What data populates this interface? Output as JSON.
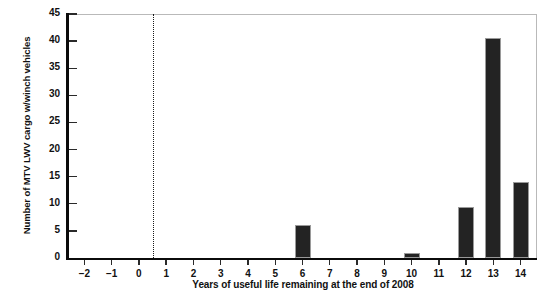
{
  "chart_data": {
    "type": "bar",
    "title": "",
    "subtitle": "",
    "xlabel": "Years of useful life remaining at the end of 2008",
    "ylabel": "Number of MTV LWV cargo w/winch vehicles",
    "categories": [
      -2,
      -1,
      0,
      1,
      2,
      3,
      4,
      5,
      6,
      7,
      8,
      9,
      10,
      11,
      12,
      13,
      14
    ],
    "values": [
      0,
      0,
      0,
      0,
      0,
      0,
      0,
      0,
      6,
      0,
      0,
      0,
      1,
      0,
      9.5,
      40.5,
      14
    ],
    "xtick_labels": [
      "−2",
      "−1",
      "0",
      "1",
      "2",
      "3",
      "4",
      "5",
      "6",
      "7",
      "8",
      "9",
      "10",
      "11",
      "12",
      "13",
      "14"
    ],
    "ytick_labels": [
      "0",
      "5",
      "10",
      "15",
      "20",
      "25",
      "30",
      "35",
      "40",
      "45"
    ],
    "yticks": [
      0,
      5,
      10,
      15,
      20,
      25,
      30,
      35,
      40,
      45
    ],
    "xlim": [
      -2.6,
      14.6
    ],
    "ylim": [
      0,
      45
    ],
    "grid": false,
    "legend": null,
    "bar_color": "#232323",
    "bar_edge_color": "#9a9a9a",
    "axis_color": "#0b0b0b",
    "frame_color": "#b9b9b9",
    "background": "#ffffff",
    "annotations": [
      {
        "name": "reference-line",
        "type": "vline",
        "x": 0.5,
        "style": "dotted",
        "color": "#1a1a1a"
      }
    ]
  }
}
